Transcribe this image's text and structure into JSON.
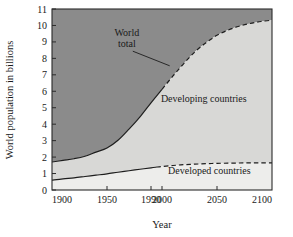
{
  "chart_data": {
    "type": "area",
    "title": "",
    "xlabel": "Year",
    "ylabel": "World population in billions",
    "xlim": [
      1900,
      2100
    ],
    "ylim": [
      0,
      11
    ],
    "grid": false,
    "legend_position": "inline-annotations",
    "x_ticks": [
      1900,
      1950,
      1990,
      2000,
      2050,
      2100
    ],
    "x_tick_labels": [
      "1900",
      "1950",
      "1990",
      "2000",
      "2050",
      "2100"
    ],
    "y_ticks": [
      0,
      1,
      2,
      3,
      4,
      5,
      6,
      7,
      8,
      9,
      10,
      11
    ],
    "y_tick_labels": [
      "0",
      "1",
      "2",
      "3",
      "4",
      "5",
      "6",
      "7",
      "8",
      "9",
      "10",
      "11"
    ],
    "historical_end_year": 2000,
    "annotations": [
      {
        "name": "world-total",
        "text": "World",
        "text2": "total",
        "x": 1968,
        "y": 9.35
      },
      {
        "name": "developing-countries",
        "text": "Developing countries",
        "x": 2038,
        "y": 5.35
      },
      {
        "name": "developed-countries",
        "text": "Developed countries",
        "x": 2043,
        "y": 0.95
      }
    ],
    "regions": [
      {
        "name": "above-world-total",
        "color": "#8b8b8b"
      },
      {
        "name": "developing-countries",
        "color": "#d8d8d6"
      },
      {
        "name": "developed-countries",
        "color": "#ededeb"
      }
    ],
    "series": [
      {
        "name": "World total",
        "style": "solid-then-dashed",
        "x": [
          1900,
          1910,
          1920,
          1930,
          1940,
          1950,
          1960,
          1970,
          1980,
          1990,
          2000,
          2010,
          2020,
          2030,
          2040,
          2050,
          2060,
          2070,
          2080,
          2090,
          2100
        ],
        "values": [
          1.7,
          1.8,
          1.9,
          2.05,
          2.3,
          2.55,
          3.02,
          3.7,
          4.45,
          5.3,
          6.12,
          6.93,
          7.7,
          8.4,
          8.95,
          9.4,
          9.72,
          9.95,
          10.12,
          10.24,
          10.32
        ]
      },
      {
        "name": "Developed countries",
        "style": "solid-then-dashed",
        "x": [
          1900,
          1910,
          1920,
          1930,
          1940,
          1950,
          1960,
          1970,
          1980,
          1990,
          2000,
          2010,
          2020,
          2030,
          2040,
          2050,
          2060,
          2070,
          2080,
          2090,
          2100
        ],
        "values": [
          0.6,
          0.68,
          0.74,
          0.82,
          0.9,
          0.98,
          1.08,
          1.17,
          1.26,
          1.35,
          1.43,
          1.49,
          1.54,
          1.57,
          1.6,
          1.62,
          1.63,
          1.64,
          1.645,
          1.65,
          1.65
        ]
      },
      {
        "name": "Developing countries",
        "style": "area-between",
        "x": [
          1900,
          1950,
          2000,
          2050,
          2100
        ],
        "values": [
          1.1,
          1.57,
          4.69,
          7.78,
          8.67
        ]
      }
    ]
  },
  "axis": {
    "ylabel": "World population in billions",
    "xlabel": "Year"
  },
  "labels": {
    "world_total_line1": "World",
    "world_total_line2": "total",
    "developing": "Developing countries",
    "developed": "Developed countries"
  }
}
